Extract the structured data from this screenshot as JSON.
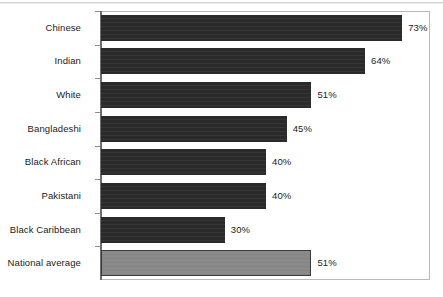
{
  "figure": {
    "kind": "horizontal-bar-chart",
    "frame_border_color": "#b9b9b9",
    "axis_color": "#6e6e6e",
    "background": "#ffffff"
  },
  "chart_data": {
    "type": "bar",
    "orientation": "horizontal",
    "title": "",
    "subtitle": "",
    "xlabel": "",
    "ylabel": "",
    "xlim": [
      0,
      80
    ],
    "grid": false,
    "legend": null,
    "value_suffix": "%",
    "categories": [
      "Chinese",
      "Indian",
      "White",
      "Bangladeshi",
      "Black African",
      "Pakistani",
      "Black Caribbean",
      "National average"
    ],
    "values": [
      73,
      64,
      51,
      45,
      40,
      40,
      30,
      51
    ],
    "data_labels": [
      "73%",
      "64%",
      "51%",
      "45%",
      "40%",
      "40%",
      "30%",
      "51%"
    ],
    "bar_colors": [
      "#2a2a2a",
      "#2a2a2a",
      "#2a2a2a",
      "#2a2a2a",
      "#2a2a2a",
      "#2a2a2a",
      "#2a2a2a",
      "#8a8a8a"
    ],
    "highlight_category": "National average",
    "highlight_color": "#8a8a8a"
  }
}
